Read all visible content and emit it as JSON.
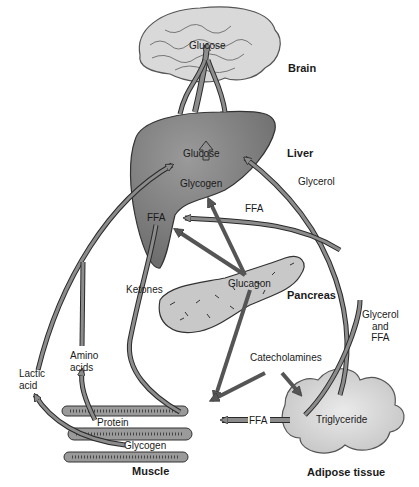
{
  "diagram": {
    "organs": {
      "brain": {
        "title": "Brain",
        "inner": "Glucose"
      },
      "liver": {
        "title": "Liver",
        "glucose": "Glucose",
        "glycogen": "Glycogen",
        "ffa": "FFA"
      },
      "pancreas": {
        "title": "Pancreas",
        "inner": "Glucagon"
      },
      "muscle": {
        "title": "Muscle",
        "protein": "Protein",
        "glycogen": "Glycogen"
      },
      "adipose": {
        "title": "Adipose tissue",
        "inner": "Triglyceride"
      }
    },
    "flows": {
      "glycerol": "Glycerol",
      "ffa_to_liver": "FFA",
      "ketones": "Ketones",
      "glycerol_and_ffa": [
        "Glycerol",
        "and",
        "FFA"
      ],
      "catecholamines": "Catecholamines",
      "ffa_to_muscle": "FFA",
      "lactic_acid": [
        "Lactic",
        "acid"
      ],
      "amino_acids": [
        "Amino",
        "acids"
      ]
    },
    "colors": {
      "organ_fill": "#7a7a7a",
      "light_fill": "#c8c8c8",
      "arrow_fill": "#8c8c8c",
      "dark_arrow": "#555555",
      "outline": "#2a2a2a"
    }
  }
}
